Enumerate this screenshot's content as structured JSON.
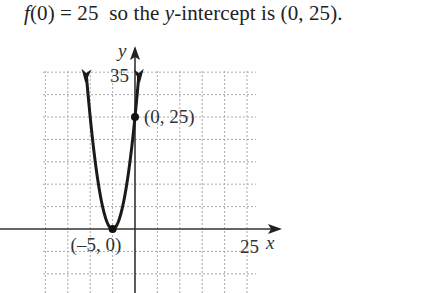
{
  "caption": {
    "func": "f",
    "arg": "(0) = 25",
    "mid": "  so the ",
    "yvar": "y",
    "rest": "-intercept is (0, 25)."
  },
  "chart_data": {
    "type": "line",
    "title": "",
    "function": "f(x) = (x + 5)^2",
    "xlabel": "x",
    "ylabel": "y",
    "xlim": [
      -20,
      30
    ],
    "ylim": [
      -10,
      35
    ],
    "grid": true,
    "grid_step": 5,
    "tick_labels": {
      "x": [
        "25"
      ],
      "y": [
        "35"
      ]
    },
    "points": [
      {
        "x": -5,
        "y": 0,
        "label": "(–5, 0)"
      },
      {
        "x": 0,
        "y": 25,
        "label": "(0, 25)"
      }
    ],
    "curve_x_range": [
      -10.9,
      0.9
    ],
    "arrows_at_ends": true
  }
}
